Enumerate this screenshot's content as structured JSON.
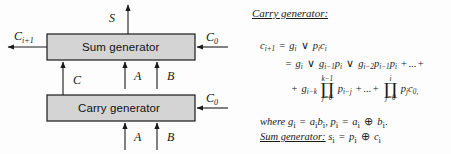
{
  "diagram": {
    "blocks": [
      {
        "id": "sum",
        "label": "Sum generator"
      },
      {
        "id": "carry",
        "label": "Carry generator"
      }
    ],
    "signals": {
      "sum_out": "S",
      "carry_out": "C",
      "carry_out_sub": "i+1",
      "carry_in_top": "C",
      "carry_in_top_sub": "0",
      "carry_in_bottom": "C",
      "carry_in_bottom_sub": "0",
      "internal_carry": "C",
      "a_top": "A",
      "b_top": "B",
      "a_bottom": "A",
      "b_bottom": "B"
    },
    "colors": {
      "box_fill": "#d4d4d4",
      "box_stroke": "#1a1a1a",
      "arrow": "#1a1a1a"
    }
  },
  "math": {
    "heading": "Carry generator:",
    "line1": {
      "lhs": "c",
      "lhs_sub": "i+1",
      "eq": "=",
      "t1": "g",
      "t1_sub": "i",
      "or1": "∨",
      "t2": "p",
      "t2_sub": "i",
      "t3": "c",
      "t3_sub": "i"
    },
    "line2": {
      "eq": "=",
      "t1": "g",
      "t1_sub": "i",
      "or1": "∨",
      "t2": "g",
      "t2_sub": "i−1",
      "t3": "p",
      "t3_sub": "i",
      "or2": "∨",
      "t4": "g",
      "t4_sub": "i−2",
      "t5": "p",
      "t5_sub": "i−1",
      "t6": "p",
      "t6_sub": "i",
      "plus": "+",
      "dots": "...",
      "plus2": "+"
    },
    "line3": {
      "plus": "+",
      "t1": "g",
      "t1_sub": "i−k",
      "prod1_top": "k−1",
      "prod1_glyph": "∏",
      "prod1_bot": "j=0",
      "t2": "p",
      "t2_sub": "i−j",
      "plus2": "+",
      "dots": "...",
      "plus3": "+",
      "prod2_top": "i",
      "prod2_glyph": "∏",
      "prod2_bot": "j=0",
      "t3": "p",
      "t3_sub": "j",
      "t4": "c",
      "t4_sub": "0,"
    },
    "where_line": {
      "kw": "where",
      "g": "g",
      "g_sub": "i",
      "eq1": "=",
      "a": "a",
      "a_sub": "i",
      "b": "b",
      "b_sub": "i",
      "comma": ",",
      "p": "p",
      "p_sub": "i",
      "eq2": "=",
      "a2": "a",
      "a2_sub": "i",
      "xor": "⊕",
      "b2": "b",
      "b2_sub": "i",
      "period": "."
    },
    "sum_line": {
      "kw": "Sum generator:",
      "s": "s",
      "s_sub": "i",
      "eq": "=",
      "p": "p",
      "p_sub": "i",
      "xor": "⊕",
      "c": "c",
      "c_sub": "i"
    }
  }
}
